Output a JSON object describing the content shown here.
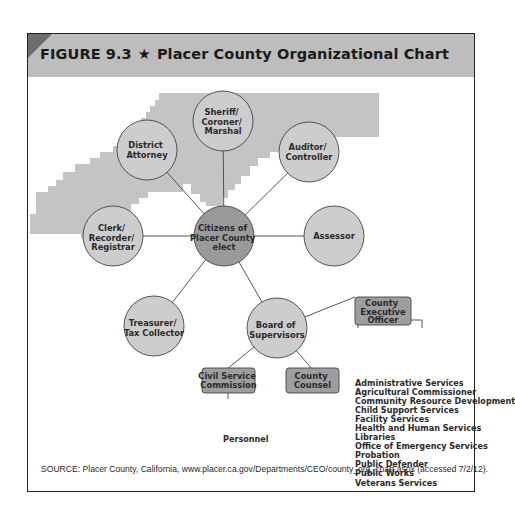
{
  "figure": {
    "number": "FIGURE 9.3",
    "star": "★",
    "title": "Placer County Organizational Chart",
    "source": "SOURCE: Placer County, California, www.placer.ca.gov/Departments/CEO/county_org_chart.aspx (accessed 7/2/12)."
  },
  "colors": {
    "header_bg": "#bdbdbd",
    "corner_accent": "#6e6e6e",
    "map_fill": "#c4c4c4",
    "circle_fill": "#cdcdcd",
    "center_circle_fill": "#9a9a9a",
    "box_fill": "#9e9e9e",
    "line": "#444444"
  },
  "nodes": {
    "center": {
      "lines": [
        "Citizens of",
        "Placer County",
        "elect"
      ]
    },
    "district_attorney": {
      "lines": [
        "District",
        "Attorney"
      ]
    },
    "sheriff": {
      "lines": [
        "Sheriff/",
        "Coroner/",
        "Marshal"
      ]
    },
    "auditor": {
      "lines": [
        "Auditor/",
        "Controller"
      ]
    },
    "clerk": {
      "lines": [
        "Clerk/",
        "Recorder/",
        "Registrar"
      ]
    },
    "assessor": {
      "lines": [
        "Assessor"
      ]
    },
    "treasurer": {
      "lines": [
        "Treasurer/",
        "Tax Collector"
      ]
    },
    "board": {
      "lines": [
        "Board of",
        "Supervisors"
      ]
    },
    "ceo": {
      "lines": [
        "County",
        "Executive",
        "Officer"
      ]
    },
    "civil_service": {
      "lines": [
        "Civil Service",
        "Commission"
      ]
    },
    "county_counsel": {
      "lines": [
        "County",
        "Counsel"
      ]
    }
  },
  "personnel_label": "Personnel",
  "ceo_departments": [
    "Administrative Services",
    "Agricultural Commissioner",
    "Community Resource Development",
    "Child Support Services",
    "Facility Services",
    "Health and Human Services",
    "Libraries",
    "Office of Emergency Services",
    "Probation",
    "Public Defender",
    "Public Works",
    "Veterans Services"
  ]
}
